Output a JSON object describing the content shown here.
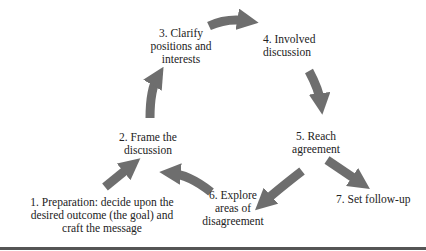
{
  "diagram": {
    "type": "process-cycle",
    "arrow_color": "#6e6e6e",
    "steps": [
      {
        "id": 1,
        "lines": [
          "1. Preparation: decide upon the",
          "desired outcome (the goal) and",
          "craft the message"
        ]
      },
      {
        "id": 2,
        "lines": [
          "2. Frame the",
          "discussion"
        ]
      },
      {
        "id": 3,
        "lines": [
          "3. Clarify",
          "positions and",
          "interests"
        ]
      },
      {
        "id": 4,
        "lines": [
          "4. Involved",
          "discussion"
        ]
      },
      {
        "id": 5,
        "lines": [
          "5. Reach",
          "agreement"
        ]
      },
      {
        "id": 6,
        "lines": [
          "6. Explore",
          "areas of",
          "disagreement"
        ]
      },
      {
        "id": 7,
        "lines": [
          "7. Set follow-up"
        ]
      }
    ],
    "edges": [
      {
        "from": 1,
        "to": 2
      },
      {
        "from": 2,
        "to": 3
      },
      {
        "from": 3,
        "to": 4
      },
      {
        "from": 4,
        "to": 5
      },
      {
        "from": 5,
        "to": 6
      },
      {
        "from": 6,
        "to": 2
      },
      {
        "from": 5,
        "to": 7
      }
    ]
  }
}
